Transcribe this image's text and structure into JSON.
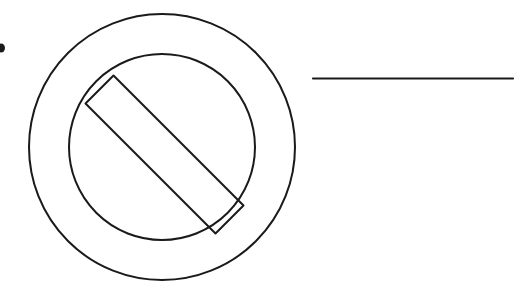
{
  "page": {
    "width": 522,
    "height": 301,
    "background_color": "#ffffff",
    "stroke_color": "#1a1a1a"
  },
  "figure": {
    "name": "no-symbol-line-art",
    "line_width": 2
  },
  "shapes": {
    "outer_circle": {
      "label": "outer-circle",
      "cx": 162,
      "cy": 147,
      "r": 133,
      "stroke_width": 2
    },
    "inner_circle": {
      "label": "inner-circle",
      "cx": 162,
      "cy": 147,
      "r": 93,
      "stroke_width": 2
    },
    "diagonal_bar": {
      "label": "diagonal-bar",
      "angle_degrees": -45,
      "stroke_width": 2,
      "points": "113.5,75.5 243.5,205.5 215.5,233.5 85.5,103.5"
    },
    "horizontal_rule": {
      "label": "horizontal-rule",
      "x1": 313,
      "y1": 78.5,
      "x2": 513,
      "y2": 78.5,
      "stroke_width": 2.2
    },
    "edge_mark": {
      "label": "edge-ink-mark",
      "cx": 1,
      "cy": 48,
      "rx": 4,
      "ry": 4.5,
      "color": "#1a1a1a"
    }
  }
}
